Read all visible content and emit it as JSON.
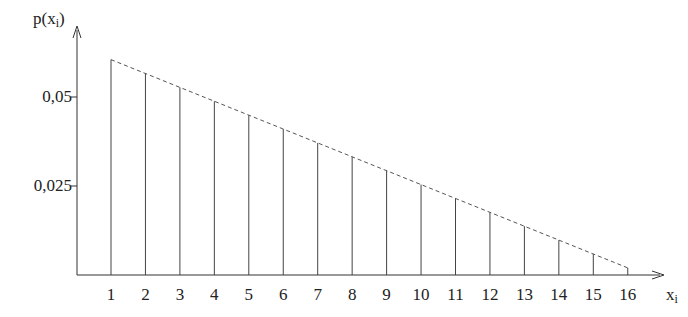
{
  "chart_data": {
    "type": "bar",
    "style": "stem plot with dashed linear envelope",
    "title": "",
    "xlabel": "x_i",
    "ylabel": "p(x_i)",
    "categories": [
      "1",
      "2",
      "3",
      "4",
      "5",
      "6",
      "7",
      "8",
      "9",
      "10",
      "11",
      "12",
      "13",
      "14",
      "15",
      "16"
    ],
    "values": [
      0.0605,
      0.0566,
      0.0527,
      0.0488,
      0.0449,
      0.041,
      0.0371,
      0.0332,
      0.0293,
      0.0254,
      0.0215,
      0.0176,
      0.0137,
      0.0098,
      0.0059,
      0.002
    ],
    "yticks": [
      {
        "value": 0.025,
        "label": "0,025"
      },
      {
        "value": 0.05,
        "label": "0,05"
      }
    ],
    "ylim": [
      0,
      0.07
    ],
    "xlim": [
      0,
      17
    ],
    "grid": false,
    "legend": null
  },
  "axes": {
    "y_label_main": "p(x",
    "y_label_sub": "i",
    "y_label_close": ")",
    "x_label_main": "x",
    "x_label_sub": "i"
  }
}
